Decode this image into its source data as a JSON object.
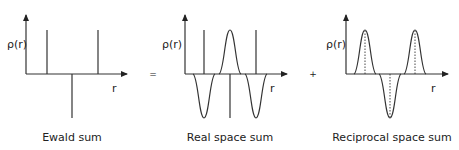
{
  "panels": [
    {
      "caption": "Ewald sum",
      "ylabel": "ρ(r)",
      "xlabel": "r"
    },
    {
      "caption": "Real space sum",
      "ylabel": "ρ(r)",
      "xlabel": "r"
    },
    {
      "caption": "Reciprocal space sum",
      "ylabel": "ρ(r)",
      "xlabel": "r"
    }
  ],
  "operators": {
    "equals": "=",
    "plus": "+"
  },
  "colors": {
    "stroke": "#333333",
    "text": "#222222"
  }
}
